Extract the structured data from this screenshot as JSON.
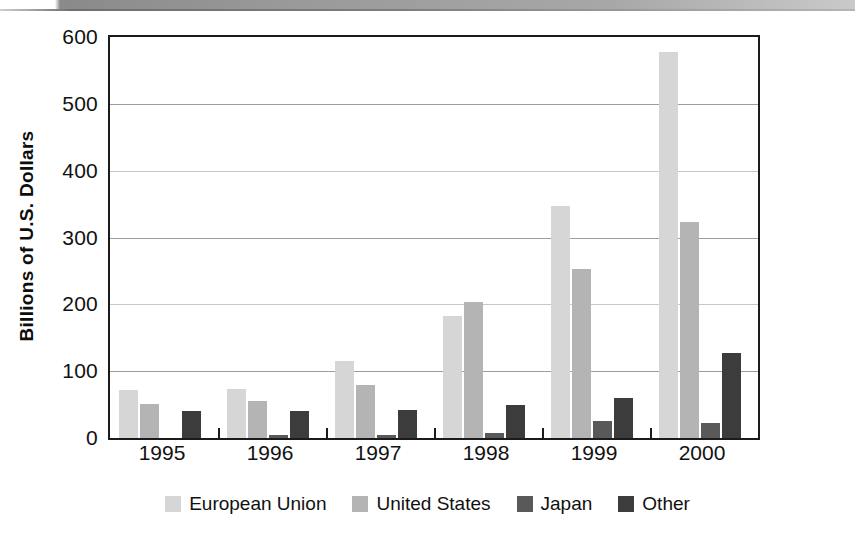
{
  "chart_data": {
    "type": "bar",
    "title": "",
    "subtitle": "",
    "xlabel": "",
    "ylabel": "Billions of U.S. Dollars",
    "categories": [
      "1995",
      "1996",
      "1997",
      "1998",
      "1999",
      "2000"
    ],
    "series": [
      {
        "name": "European Union",
        "color": "#d6d6d6",
        "values": [
          72,
          73,
          115,
          183,
          347,
          577
        ]
      },
      {
        "name": "United States",
        "color": "#b4b4b4",
        "values": [
          51,
          56,
          80,
          203,
          253,
          323
        ]
      },
      {
        "name": "Japan",
        "color": "#595959",
        "values": [
          0,
          5,
          5,
          8,
          25,
          22
        ]
      },
      {
        "name": "Other",
        "color": "#3c3c3c",
        "values": [
          40,
          40,
          42,
          50,
          60,
          127
        ]
      }
    ],
    "ylim": [
      0,
      600
    ],
    "yticks": [
      0,
      100,
      200,
      300,
      400,
      500,
      600
    ],
    "ytick_labels": [
      "0",
      "100",
      "200",
      "300",
      "400",
      "500",
      "600"
    ],
    "grid": true,
    "grid_axis": "y",
    "legend_position": "bottom",
    "axis_color": "#1b1b1b",
    "grid_color": "#9d9d9d",
    "background_color": "#ffffff"
  },
  "legend": {
    "items": [
      {
        "label": "European Union",
        "color": "#d6d6d6"
      },
      {
        "label": "United States",
        "color": "#b4b4b4"
      },
      {
        "label": "Japan",
        "color": "#595959"
      },
      {
        "label": "Other",
        "color": "#3c3c3c"
      }
    ]
  }
}
